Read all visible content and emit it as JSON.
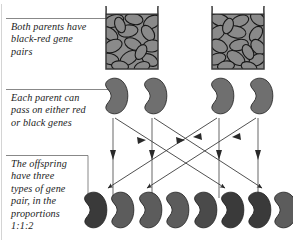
{
  "figure": {
    "title_hidden": "",
    "background": "#ffffff",
    "ink": "#1b1b1b",
    "bean_fill_red": "#6f6f6f",
    "bean_fill_black": "#3a3a3a",
    "bean_outline": "#1c1c1c",
    "jar_outline": "#3a3a3a",
    "jar_fill": "#8a8a8a",
    "leader_color": "#5a5a5a"
  },
  "captions": [
    {
      "id": "caption-parents",
      "text": "Both parents have\nblack-red gene\npairs",
      "leader": "horizontal"
    },
    {
      "id": "caption-gametes",
      "text": "Each parent can\npass on either red\nor black genes",
      "leader": "horizontal"
    },
    {
      "id": "caption-offspring",
      "text": "The offspring\nhave three\ntypes of gene\npair, in the\nproportions\n1:1:2",
      "leader": "elbow"
    }
  ],
  "parents": [
    {
      "name": "parent-jar-left",
      "x": 104,
      "y": 8,
      "w": 56,
      "h": 62,
      "label": "black-red gene pair jar"
    },
    {
      "name": "parent-jar-right",
      "x": 210,
      "y": 8,
      "w": 56,
      "h": 62,
      "label": "black-red gene pair jar"
    }
  ],
  "gametes": [
    {
      "name": "gamete-bean-1",
      "cx": 113,
      "cy": 97,
      "color": "red"
    },
    {
      "name": "gamete-bean-2",
      "cx": 152,
      "cy": 97,
      "color": "red"
    },
    {
      "name": "gamete-bean-3",
      "cx": 219,
      "cy": 97,
      "color": "red"
    },
    {
      "name": "gamete-bean-4",
      "cx": 258,
      "cy": 97,
      "color": "red"
    }
  ],
  "offspring": [
    {
      "name": "offspring-bean-1",
      "cx": 93,
      "cy": 211,
      "color": "black"
    },
    {
      "name": "offspring-bean-2",
      "cx": 119,
      "cy": 211,
      "color": "red"
    },
    {
      "name": "offspring-bean-3",
      "cx": 148,
      "cy": 211,
      "color": "red"
    },
    {
      "name": "offspring-bean-4",
      "cx": 174,
      "cy": 211,
      "color": "red"
    },
    {
      "name": "offspring-bean-5",
      "cx": 203,
      "cy": 211,
      "color": "black"
    },
    {
      "name": "offspring-bean-6",
      "cx": 229,
      "cy": 211,
      "color": "black"
    },
    {
      "name": "offspring-bean-7",
      "cx": 256,
      "cy": 211,
      "color": "black"
    },
    {
      "name": "offspring-bean-8",
      "cx": 281,
      "cy": 211,
      "color": "red"
    }
  ],
  "arrows": {
    "vertical_count": 4,
    "diagonal_count": 4,
    "description": "Each gamete sends one straight arrow down and one crossing diagonal arrow"
  },
  "ratio_text": "1:1:2"
}
